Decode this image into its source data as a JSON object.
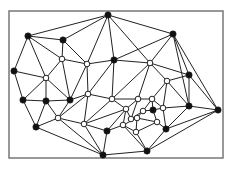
{
  "diagram": {
    "type": "planar-graph-triangulation",
    "frame": {
      "x": 9,
      "y": 11,
      "width": 214,
      "height": 147
    },
    "colors": {
      "edge": "#222222",
      "frame": "#777777",
      "node_black": "#111111",
      "node_white": "#ffffff"
    },
    "nodes": [
      {
        "id": 0,
        "x": 108,
        "y": 15,
        "kind": "black"
      },
      {
        "id": 1,
        "x": 28,
        "y": 36,
        "kind": "black"
      },
      {
        "id": 2,
        "x": 63,
        "y": 40,
        "kind": "black"
      },
      {
        "id": 3,
        "x": 173,
        "y": 34,
        "kind": "black"
      },
      {
        "id": 4,
        "x": 14,
        "y": 71,
        "kind": "black"
      },
      {
        "id": 5,
        "x": 62,
        "y": 59,
        "kind": "white"
      },
      {
        "id": 6,
        "x": 87,
        "y": 64,
        "kind": "white"
      },
      {
        "id": 7,
        "x": 114,
        "y": 60,
        "kind": "black"
      },
      {
        "id": 8,
        "x": 150,
        "y": 63,
        "kind": "white"
      },
      {
        "id": 9,
        "x": 189,
        "y": 75,
        "kind": "black"
      },
      {
        "id": 10,
        "x": 46,
        "y": 78,
        "kind": "white"
      },
      {
        "id": 11,
        "x": 167,
        "y": 81,
        "kind": "white"
      },
      {
        "id": 12,
        "x": 23,
        "y": 100,
        "kind": "black"
      },
      {
        "id": 13,
        "x": 46,
        "y": 101,
        "kind": "black"
      },
      {
        "id": 14,
        "x": 70,
        "y": 100,
        "kind": "black"
      },
      {
        "id": 15,
        "x": 88,
        "y": 94,
        "kind": "white"
      },
      {
        "id": 16,
        "x": 112,
        "y": 99,
        "kind": "white"
      },
      {
        "id": 17,
        "x": 138,
        "y": 99,
        "kind": "white"
      },
      {
        "id": 18,
        "x": 152,
        "y": 99,
        "kind": "white"
      },
      {
        "id": 19,
        "x": 126,
        "y": 109,
        "kind": "white"
      },
      {
        "id": 20,
        "x": 143,
        "y": 111,
        "kind": "white"
      },
      {
        "id": 21,
        "x": 153,
        "y": 110,
        "kind": "black"
      },
      {
        "id": 22,
        "x": 163,
        "y": 108,
        "kind": "white"
      },
      {
        "id": 23,
        "x": 189,
        "y": 106,
        "kind": "black"
      },
      {
        "id": 24,
        "x": 218,
        "y": 110,
        "kind": "black"
      },
      {
        "id": 25,
        "x": 36,
        "y": 127,
        "kind": "black"
      },
      {
        "id": 26,
        "x": 58,
        "y": 118,
        "kind": "white"
      },
      {
        "id": 27,
        "x": 84,
        "y": 124,
        "kind": "white"
      },
      {
        "id": 28,
        "x": 107,
        "y": 131,
        "kind": "black"
      },
      {
        "id": 29,
        "x": 123,
        "y": 125,
        "kind": "white"
      },
      {
        "id": 30,
        "x": 137,
        "y": 118,
        "kind": "white"
      },
      {
        "id": 31,
        "x": 157,
        "y": 122,
        "kind": "white"
      },
      {
        "id": 32,
        "x": 166,
        "y": 129,
        "kind": "black"
      },
      {
        "id": 33,
        "x": 136,
        "y": 132,
        "kind": "white"
      },
      {
        "id": 34,
        "x": 103,
        "y": 155,
        "kind": "black"
      },
      {
        "id": 35,
        "x": 147,
        "y": 151,
        "kind": "black"
      },
      {
        "id": 36,
        "x": 131,
        "y": 119,
        "kind": "white"
      }
    ],
    "edges": [
      [
        0,
        1
      ],
      [
        0,
        2
      ],
      [
        0,
        3
      ],
      [
        0,
        6
      ],
      [
        0,
        7
      ],
      [
        0,
        8
      ],
      [
        1,
        2
      ],
      [
        1,
        4
      ],
      [
        1,
        5
      ],
      [
        1,
        10
      ],
      [
        2,
        5
      ],
      [
        2,
        6
      ],
      [
        3,
        7
      ],
      [
        3,
        8
      ],
      [
        3,
        9
      ],
      [
        3,
        23
      ],
      [
        3,
        24
      ],
      [
        4,
        10
      ],
      [
        4,
        12
      ],
      [
        5,
        6
      ],
      [
        5,
        10
      ],
      [
        5,
        14
      ],
      [
        6,
        7
      ],
      [
        6,
        14
      ],
      [
        6,
        15
      ],
      [
        7,
        8
      ],
      [
        7,
        15
      ],
      [
        7,
        16
      ],
      [
        8,
        9
      ],
      [
        8,
        11
      ],
      [
        8,
        16
      ],
      [
        8,
        17
      ],
      [
        9,
        11
      ],
      [
        9,
        23
      ],
      [
        9,
        24
      ],
      [
        10,
        12
      ],
      [
        10,
        13
      ],
      [
        10,
        14
      ],
      [
        11,
        18
      ],
      [
        11,
        22
      ],
      [
        11,
        23
      ],
      [
        12,
        13
      ],
      [
        12,
        25
      ],
      [
        13,
        14
      ],
      [
        13,
        26
      ],
      [
        13,
        25
      ],
      [
        14,
        15
      ],
      [
        14,
        26
      ],
      [
        15,
        16
      ],
      [
        15,
        27
      ],
      [
        15,
        26
      ],
      [
        16,
        17
      ],
      [
        16,
        19
      ],
      [
        16,
        27
      ],
      [
        17,
        18
      ],
      [
        17,
        19
      ],
      [
        17,
        36
      ],
      [
        18,
        20
      ],
      [
        18,
        21
      ],
      [
        18,
        22
      ],
      [
        19,
        27
      ],
      [
        19,
        28
      ],
      [
        19,
        29
      ],
      [
        19,
        36
      ],
      [
        20,
        21
      ],
      [
        20,
        36
      ],
      [
        20,
        30
      ],
      [
        21,
        22
      ],
      [
        21,
        31
      ],
      [
        22,
        23
      ],
      [
        22,
        32
      ],
      [
        23,
        24
      ],
      [
        23,
        32
      ],
      [
        24,
        32
      ],
      [
        24,
        35
      ],
      [
        25,
        26
      ],
      [
        25,
        34
      ],
      [
        26,
        27
      ],
      [
        26,
        34
      ],
      [
        27,
        28
      ],
      [
        27,
        34
      ],
      [
        28,
        29
      ],
      [
        28,
        34
      ],
      [
        29,
        30
      ],
      [
        29,
        33
      ],
      [
        29,
        35
      ],
      [
        30,
        31
      ],
      [
        30,
        33
      ],
      [
        30,
        36
      ],
      [
        31,
        32
      ],
      [
        31,
        33
      ],
      [
        32,
        35
      ],
      [
        33,
        35
      ],
      [
        34,
        35
      ]
    ]
  }
}
